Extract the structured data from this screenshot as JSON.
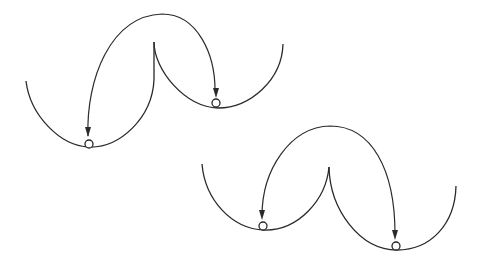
{
  "figure": {
    "colors": {
      "line": "#2a2a2a",
      "background": "#ffffff"
    }
  },
  "diagrams": [
    {
      "name": "upper-double-well",
      "left_well": {
        "minimum": [
          89,
          145
        ],
        "ball": [
          89,
          144
        ]
      },
      "right_well": {
        "minimum": [
          216,
          104
        ],
        "ball": [
          216,
          103
        ]
      },
      "barrier_cusp": [
        154,
        42
      ],
      "arrows": [
        "barrier-crossing arc from right well region to left well",
        "arc into right well"
      ]
    },
    {
      "name": "lower-double-well",
      "left_well": {
        "minimum": [
          263,
          227
        ],
        "ball": [
          263,
          226
        ]
      },
      "right_well": {
        "minimum": [
          396,
          247
        ],
        "ball": [
          396,
          246
        ]
      },
      "barrier_cusp": [
        329,
        167
      ],
      "arrows": [
        "arc into left well",
        "arc into right well"
      ]
    }
  ]
}
